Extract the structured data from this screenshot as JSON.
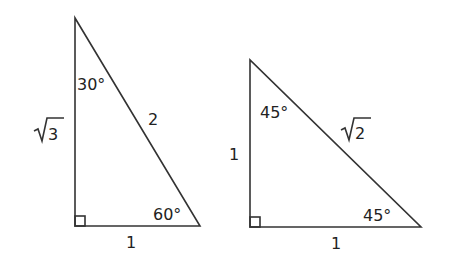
{
  "diagram": {
    "triangles": [
      {
        "name": "30-60-90 triangle",
        "angles": {
          "top": "30°",
          "bottom_right": "60°",
          "bottom_left": "right-angle"
        },
        "sides": {
          "vertical": "3",
          "vertical_prefix": "√",
          "hypotenuse": "2",
          "base": "1"
        }
      },
      {
        "name": "45-45-90 triangle",
        "angles": {
          "top": "45°",
          "bottom_right": "45°",
          "bottom_left": "right-angle"
        },
        "sides": {
          "vertical": "1",
          "hypotenuse": "2",
          "hypotenuse_prefix": "√",
          "base": "1"
        }
      }
    ]
  }
}
